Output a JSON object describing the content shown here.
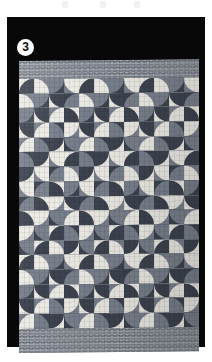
{
  "figure": {
    "number_label": "3",
    "badge_icon": "circled-number-badge",
    "background_color": "#080809",
    "page_color": "#ffffff"
  },
  "quilt": {
    "pattern_name": "drunkard's path curved patchwork",
    "palette": {
      "dark": "#3e4450",
      "medium": "#79808c",
      "light": "#eceae4",
      "sashing": "#7d838d"
    },
    "grid": {
      "columns": 12,
      "rows": 17,
      "cell_px": 15
    },
    "borders": {
      "top_label": "textured lattice sashing",
      "bottom_label": "textured lattice sashing"
    }
  },
  "top_marks": {
    "count": 3,
    "label": "faint scan artifacts"
  },
  "chart_data": {
    "type": "heatmap",
    "title": "",
    "xlabel": "",
    "ylabel": "",
    "legend": [
      "dark",
      "medium",
      "light"
    ],
    "categories": [
      "1",
      "2",
      "3",
      "4",
      "5",
      "6",
      "7",
      "8",
      "9",
      "10",
      "11",
      "12"
    ],
    "tone_map": [
      [
        "light",
        "medium",
        "dark",
        "medium",
        "light",
        "medium",
        "dark",
        "medium",
        "light",
        "medium",
        "dark",
        "medium"
      ],
      [
        "medium",
        "dark",
        "light",
        "dark",
        "medium",
        "dark",
        "light",
        "dark",
        "medium",
        "dark",
        "light",
        "dark"
      ],
      [
        "dark",
        "light",
        "medium",
        "light",
        "dark",
        "light",
        "medium",
        "light",
        "dark",
        "light",
        "medium",
        "light"
      ],
      [
        "light",
        "medium",
        "dark",
        "medium",
        "light",
        "medium",
        "dark",
        "medium",
        "light",
        "medium",
        "dark",
        "medium"
      ],
      [
        "medium",
        "dark",
        "light",
        "dark",
        "medium",
        "dark",
        "light",
        "dark",
        "medium",
        "dark",
        "light",
        "dark"
      ],
      [
        "dark",
        "light",
        "medium",
        "light",
        "dark",
        "light",
        "medium",
        "light",
        "dark",
        "light",
        "medium",
        "light"
      ],
      [
        "light",
        "medium",
        "dark",
        "medium",
        "light",
        "medium",
        "dark",
        "medium",
        "light",
        "medium",
        "dark",
        "medium"
      ],
      [
        "medium",
        "dark",
        "light",
        "dark",
        "medium",
        "dark",
        "light",
        "dark",
        "medium",
        "dark",
        "light",
        "dark"
      ],
      [
        "dark",
        "light",
        "medium",
        "light",
        "dark",
        "light",
        "medium",
        "light",
        "dark",
        "light",
        "medium",
        "light"
      ],
      [
        "light",
        "medium",
        "dark",
        "medium",
        "light",
        "medium",
        "dark",
        "medium",
        "light",
        "medium",
        "dark",
        "medium"
      ],
      [
        "medium",
        "dark",
        "light",
        "dark",
        "medium",
        "dark",
        "light",
        "dark",
        "medium",
        "dark",
        "light",
        "dark"
      ],
      [
        "dark",
        "light",
        "medium",
        "light",
        "dark",
        "light",
        "medium",
        "light",
        "dark",
        "light",
        "medium",
        "light"
      ],
      [
        "light",
        "medium",
        "dark",
        "medium",
        "light",
        "medium",
        "dark",
        "medium",
        "light",
        "medium",
        "dark",
        "medium"
      ],
      [
        "medium",
        "dark",
        "light",
        "dark",
        "medium",
        "dark",
        "light",
        "dark",
        "medium",
        "dark",
        "light",
        "dark"
      ],
      [
        "dark",
        "light",
        "medium",
        "light",
        "dark",
        "light",
        "medium",
        "light",
        "dark",
        "light",
        "medium",
        "light"
      ],
      [
        "light",
        "medium",
        "dark",
        "medium",
        "light",
        "medium",
        "dark",
        "medium",
        "light",
        "medium",
        "dark",
        "medium"
      ],
      [
        "medium",
        "dark",
        "light",
        "dark",
        "medium",
        "dark",
        "light",
        "dark",
        "medium",
        "dark",
        "light",
        "dark"
      ]
    ],
    "arc_corner_cycle": [
      "c-br",
      "c-bl",
      "c-tl",
      "c-tr"
    ]
  }
}
